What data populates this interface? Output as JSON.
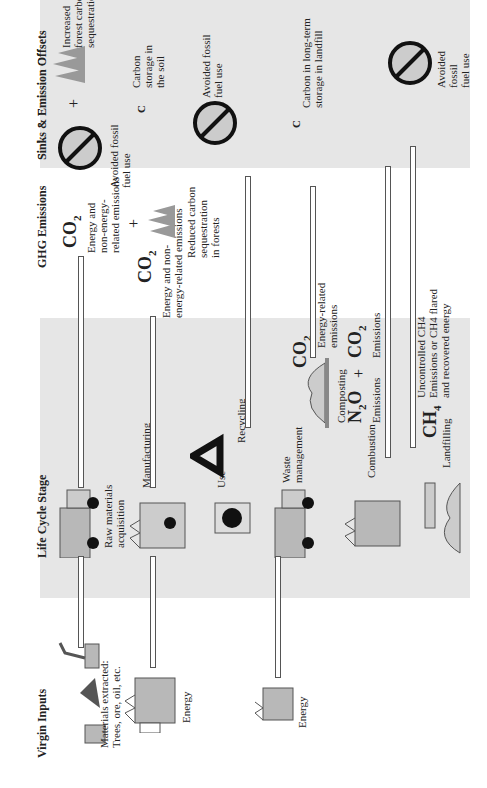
{
  "columns": {
    "virgin_inputs": "Virgin Inputs",
    "life_cycle_stage": "Life Cycle Stage",
    "ghg_emissions": "GHG Emissions",
    "sinks_offsets": "Sinks & Emission Offsets"
  },
  "virgin_inputs": {
    "materials_line1": "Materials extracted:",
    "materials_line2": "Trees, ore, oil, etc.",
    "energy1": "Energy",
    "energy2": "Energy"
  },
  "life_cycle": {
    "raw_line1": "Raw materials",
    "raw_line2": "acquisition",
    "manufacturing": "Manufacturing",
    "use": "Use",
    "recycling": "Recycling",
    "waste_line1": "Waste",
    "waste_line2": "management",
    "composting": "Composting",
    "combustion": "Combustion",
    "landfilling": "Landfilling"
  },
  "emissions": {
    "co2_a": "CO",
    "co2_a_sub": "2",
    "co2_a_l1": "Energy and",
    "co2_a_l2": "non-energy-",
    "co2_a_l3": "related emissions",
    "plus1": "+",
    "forest_l1": "Reduced carbon",
    "forest_l2": "sequestration",
    "forest_l3": "in forests",
    "co2_b": "CO",
    "co2_b_sub": "2",
    "co2_b_l1": "Energy and non-",
    "co2_b_l2": "energy-related emissions",
    "co2_c": "CO",
    "co2_c_sub": "2",
    "co2_c_l1": "Energy-related",
    "co2_c_l2": "emissions",
    "n2o": "N",
    "n2o_sub": "2",
    "n2o_tail": "O",
    "n2o_label": "Emissions",
    "plus2": "+",
    "co2_d": "CO",
    "co2_d_sub": "2",
    "co2_d_label": "Emissions",
    "ch4": "CH",
    "ch4_sub": "4",
    "ch4_l1": "Uncontrolled CH4",
    "ch4_l2": "Emissions or CH4 flared",
    "ch4_l3": "and recovered energy"
  },
  "sinks": {
    "avoided1_l1": "Avoided fossil",
    "avoided1_l2": "fuel use",
    "plus": "+",
    "forest_l1": "Increased",
    "forest_l2": "forest carbon",
    "forest_l3": "sequestration",
    "c1": "C",
    "soil_l1": "Carbon",
    "soil_l2": "storage in",
    "soil_l3": "the soil",
    "avoided2_l1": "Avoided fossil",
    "avoided2_l2": "fuel use",
    "c2": "C",
    "landfill_l1": "Carbon in long-term",
    "landfill_l2": "storage in landfill",
    "avoided3_l1": "Avoided",
    "avoided3_l2": "fossil",
    "avoided3_l3": "fuel use"
  },
  "colors": {
    "band": "#e6e6e6",
    "stroke": "#555555",
    "icon_fill": "#b8b8b8",
    "dark": "#111111"
  }
}
